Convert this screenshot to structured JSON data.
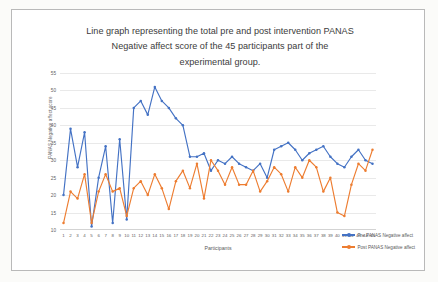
{
  "chart_data": {
    "type": "line",
    "title_lines": [
      "Line graph representing the total pre and post intervention PANAS",
      "Negative affect score of the 45 participants part of the",
      "experimental group."
    ],
    "xlabel": "Participants",
    "ylabel": "PANAS Negative affect score",
    "ylim": [
      10,
      55
    ],
    "yticks": [
      55,
      50,
      45,
      40,
      35,
      30,
      25,
      20,
      15,
      10
    ],
    "grid": true,
    "legend_position": "right",
    "categories": [
      1,
      2,
      3,
      4,
      5,
      6,
      7,
      8,
      9,
      10,
      11,
      12,
      13,
      14,
      15,
      16,
      17,
      18,
      19,
      20,
      21,
      22,
      23,
      24,
      25,
      26,
      27,
      28,
      29,
      30,
      31,
      32,
      33,
      34,
      35,
      36,
      37,
      38,
      39,
      40,
      41,
      42,
      43,
      44,
      45
    ],
    "series": [
      {
        "name": "Pre PANAS Negative affect",
        "color": "#4472C4",
        "values": [
          20,
          39,
          28,
          38,
          11,
          25,
          34,
          12,
          36,
          13,
          45,
          47,
          43,
          51,
          47,
          45,
          42,
          40,
          31,
          31,
          32,
          27,
          30,
          29,
          31,
          29,
          28,
          27,
          29,
          25,
          33,
          34,
          35,
          33,
          30,
          32,
          33,
          34,
          31,
          29,
          28,
          31,
          33,
          30,
          29
        ]
      },
      {
        "name": "Post PANAS Negative affect",
        "color": "#ED7D31",
        "values": [
          12,
          21,
          19,
          26,
          12,
          21,
          26,
          21,
          22,
          14,
          22,
          24,
          20,
          26,
          22,
          16,
          24,
          27,
          22,
          29,
          19,
          30,
          27,
          23,
          28,
          23,
          23,
          27,
          21,
          24,
          28,
          26,
          21,
          28,
          25,
          30,
          28,
          21,
          25,
          15,
          14,
          23,
          29,
          27,
          33
        ]
      }
    ]
  },
  "legend": {
    "entries": [
      {
        "label": "Pre PANAS Negative affect"
      },
      {
        "label": "Post PANAS Negative affect"
      }
    ]
  }
}
